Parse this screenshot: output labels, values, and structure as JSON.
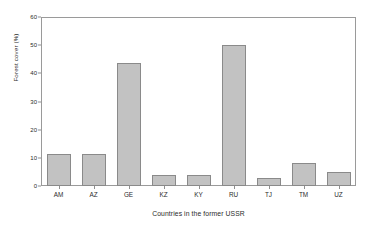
{
  "chart_data": {
    "type": "bar",
    "title": "",
    "xlabel": "Countries in the former USSR",
    "ylabel": "Forest cover (%)",
    "categories": [
      "AM",
      "AZ",
      "GE",
      "KZ",
      "KY",
      "RU",
      "TJ",
      "TM",
      "UZ"
    ],
    "values": [
      11.5,
      11.2,
      43.5,
      4.0,
      4.0,
      50.0,
      3.0,
      8.0,
      5.0
    ],
    "ylim": [
      0,
      60
    ],
    "yticks": [
      0,
      10,
      20,
      30,
      40,
      50,
      60
    ],
    "ytick_labels": [
      "0",
      "10",
      "20",
      "30",
      "40",
      "50",
      "60"
    ],
    "grid": false,
    "legend": "none",
    "bar_color": "#c2c2c2",
    "bar_border_color": "#8a8a8a",
    "axis_color": "#9a9a9a",
    "background": "#ffffff"
  }
}
